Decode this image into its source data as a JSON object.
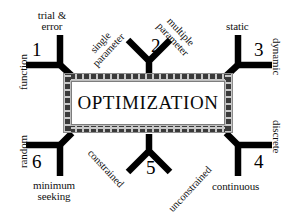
{
  "diagram": {
    "title": "OPTIMIZATION",
    "type": "optimization-classification-chart",
    "background_color": "#ffffff",
    "ink_color": "#000000",
    "border_color": "#9a9a9a",
    "branches": [
      {
        "number": "1",
        "position": "top-left",
        "labels": [
          "trial & error",
          "function"
        ],
        "label_top_line1": "trial &",
        "label_top_line2": "error",
        "label_side": "function"
      },
      {
        "number": "2",
        "position": "top-center",
        "labels": [
          "single parameter",
          "multiple parameter"
        ],
        "label_left_line1": "single",
        "label_left_line2": "parameter",
        "label_right_line1": "multiple",
        "label_right_line2": "parameter"
      },
      {
        "number": "3",
        "position": "top-right",
        "labels": [
          "static",
          "dynamic"
        ],
        "label_top": "static",
        "label_side": "dynamic"
      },
      {
        "number": "4",
        "position": "bottom-right",
        "labels": [
          "discrete",
          "continuous"
        ],
        "label_side": "discrete",
        "label_bottom": "continuous"
      },
      {
        "number": "5",
        "position": "bottom-center",
        "labels": [
          "constrained",
          "unconstrained"
        ],
        "label_left": "constrained",
        "label_right": "unconstrained"
      },
      {
        "number": "6",
        "position": "bottom-left",
        "labels": [
          "random",
          "minimum seeking"
        ],
        "label_side": "random",
        "label_bottom_line1": "minimum",
        "label_bottom_line2": "seeking"
      }
    ]
  }
}
